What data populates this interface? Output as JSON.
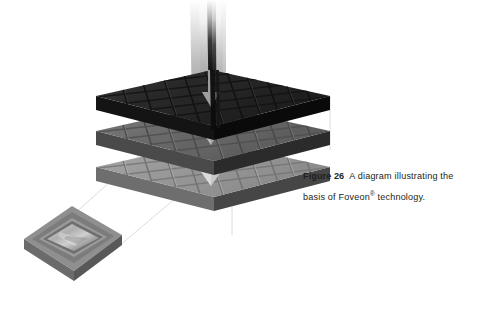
{
  "figure": {
    "background_color": "#ffffff",
    "caption": {
      "label": "Figure 26",
      "text": "A diagram illustrating the basis of Foveon",
      "trademark": "®",
      "text_tail": " technology.",
      "full_text": "Figure 26  A diagram illustrating the basis of Foveon® technology.",
      "text_color": "#231f20"
    },
    "diagram": {
      "title": "Foveon three-layer image sensor",
      "type": "isometric-layer-stack",
      "light_beam": {
        "name": "incoming-light-beam",
        "description": "vertical shaft of light entering from the top",
        "top_color": "#ffffff",
        "mid_color": "#9b9b9b",
        "stripe_color": "#141414"
      },
      "layers": [
        {
          "index": 0,
          "name": "blue-layer",
          "position": "top",
          "face_color": "#2b2b2b",
          "cell_color": "#323232",
          "side_color": "#0d0d0d",
          "grid_columns": 6,
          "grid_rows": 6,
          "arrow_color": "#7c7c7c"
        },
        {
          "index": 1,
          "name": "green-layer",
          "position": "middle",
          "face_color": "#6c6c6c",
          "cell_color": "#757575",
          "side_color": "#2a2a2a",
          "grid_columns": 6,
          "grid_rows": 6,
          "arrow_color": "#a0a0a0"
        },
        {
          "index": 2,
          "name": "red-layer",
          "position": "bottom",
          "face_color": "#9a9a9a",
          "cell_color": "#a2a2a2",
          "side_color": "#5a5a5a",
          "grid_columns": 6,
          "grid_rows": 6,
          "arrow_color": "#c8c8c8"
        }
      ],
      "chip": {
        "name": "image-sensor-chip",
        "description": "packaged image sensor chip shown at lower left",
        "package_color": "#8a8a8a",
        "bezel_color": "#6e6e6e",
        "die_color": "#b9b9b9"
      },
      "callout": {
        "name": "callout-lines",
        "color": "#d8d8d8",
        "description": "faint guide lines linking the chip to the magnified layer stack"
      }
    }
  }
}
